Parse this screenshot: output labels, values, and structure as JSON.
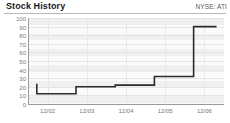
{
  "header": {
    "title": "Stock History",
    "ticker": "NYSE: ATI"
  },
  "chart_data": {
    "type": "line",
    "title": "Stock History",
    "subtitle": "NYSE: ATI",
    "xlabel": "",
    "ylabel": "",
    "grid": true,
    "legend": "none",
    "step": "post",
    "ylim": [
      0,
      100
    ],
    "yticks": [
      100,
      90,
      80,
      70,
      60,
      50,
      40,
      30,
      20,
      10,
      0
    ],
    "categories": [
      "12/02",
      "12/03",
      "12/04",
      "12/05",
      "12/06"
    ],
    "x": [
      "12/02",
      "12/03",
      "12/04",
      "12/05",
      "12/06"
    ],
    "values": [
      12,
      20,
      22,
      32,
      90
    ],
    "series": [
      {
        "name": "Stock price",
        "values": [
          12,
          20,
          22,
          32,
          90
        ]
      }
    ]
  },
  "axis": {
    "y": {
      "t100": "100",
      "t90": "90",
      "t80": "80",
      "t70": "70",
      "t60": "60",
      "t50": "50",
      "t40": "40",
      "t30": "30",
      "t20": "20",
      "t10": "10",
      "t0": "0"
    },
    "x": {
      "t0": "12/02",
      "t1": "12/03",
      "t2": "12/04",
      "t3": "12/05",
      "t4": "12/06"
    }
  },
  "colors": {
    "series": "#2b2b2b",
    "band": "#f0f0f0",
    "grid": "#e4e4e4",
    "axis": "#9a9a9a",
    "tick_text": "#777777",
    "title_text": "#1a1a1a"
  }
}
